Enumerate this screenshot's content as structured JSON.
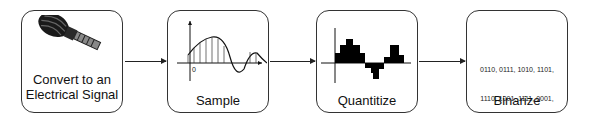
{
  "diagram": {
    "type": "flowchart",
    "direction": "left-to-right",
    "steps": [
      {
        "label_line1": "Convert to an",
        "label_line2": "Electrical Signal",
        "icon": "microphone-icon"
      },
      {
        "label": "Sample",
        "icon": "sampled-waveform-icon"
      },
      {
        "label": "Quantitize",
        "icon": "quantized-waveform-icon"
      },
      {
        "label": "Binarize",
        "binary_lines": [
          "0110, 0111, 1010, 1101,",
          "1110, 1001, 1111, 0001,",
          "1010, 1101, 1100, 0110"
        ]
      }
    ],
    "edges": [
      {
        "from": 0,
        "to": 1
      },
      {
        "from": 1,
        "to": 2
      },
      {
        "from": 2,
        "to": 3
      }
    ],
    "sample_axis_label": "0",
    "colors": {
      "stroke": "#333333",
      "fill": "#000000",
      "background": "#ffffff"
    }
  }
}
